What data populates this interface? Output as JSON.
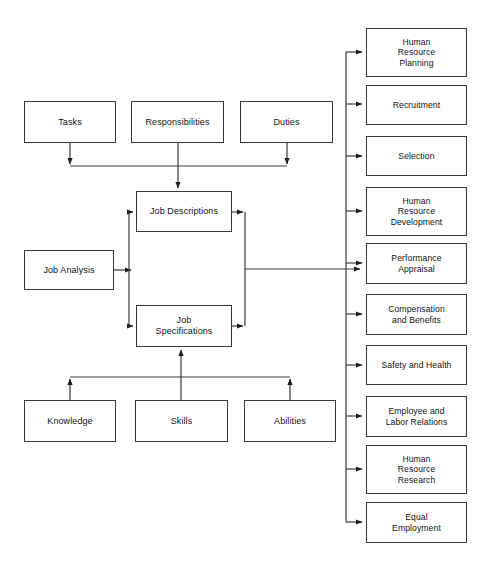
{
  "diagram": {
    "stroke_color": "#3a3a3a",
    "text_color": "#111111",
    "background": "#ffffff",
    "inputs_top": [
      {
        "label": "Tasks"
      },
      {
        "label": "Responsibilities"
      },
      {
        "label": "Duties"
      }
    ],
    "process": {
      "label": "Job Analysis"
    },
    "outputs_core": [
      {
        "label": "Job Descriptions"
      },
      {
        "label": "Job\nSpecifications"
      }
    ],
    "inputs_bottom": [
      {
        "label": "Knowledge"
      },
      {
        "label": "Skills"
      },
      {
        "label": "Abilities"
      }
    ],
    "hr_functions": [
      {
        "label": "Human\nResource\nPlanning"
      },
      {
        "label": "Recruitment"
      },
      {
        "label": "Selection"
      },
      {
        "label": "Human\nResource\nDevelopment"
      },
      {
        "label": "Performance\nAppraisal"
      },
      {
        "label": "Compensation\nand Benefits"
      },
      {
        "label": "Safety and Health"
      },
      {
        "label": "Employee and\nLabor Relations"
      },
      {
        "label": "Human\nResource\nResearch"
      },
      {
        "label": "Equal\nEmployment"
      }
    ]
  }
}
